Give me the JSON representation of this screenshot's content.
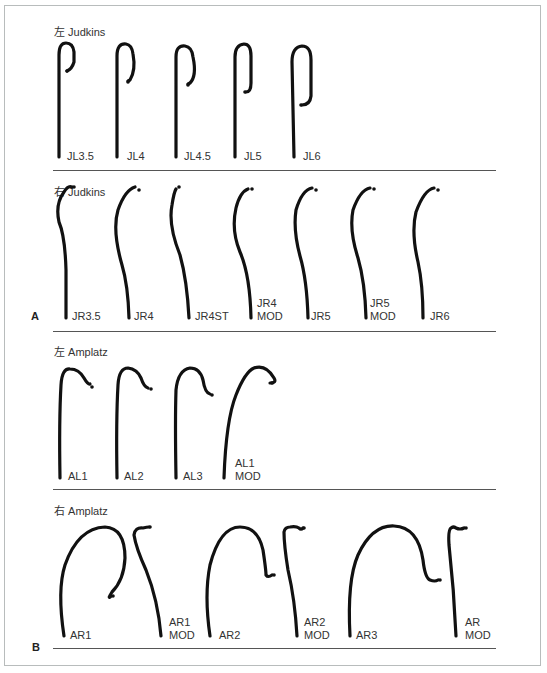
{
  "figure": {
    "sections": [
      {
        "id": "left-judkins",
        "title": "左 Judkins",
        "catheters": [
          "JL3.5",
          "JL4",
          "JL4.5",
          "JL5",
          "JL6"
        ]
      },
      {
        "id": "right-judkins",
        "title": "右 Judkins",
        "catheters": [
          "JR3.5",
          "JR4",
          "JR4ST",
          "JR4\nMOD",
          "JR5",
          "JR5\nMOD",
          "JR6"
        ]
      },
      {
        "id": "left-amplatz",
        "title": "左 Amplatz",
        "catheters": [
          "AL1",
          "AL2",
          "AL3",
          "AL1\nMOD"
        ]
      },
      {
        "id": "right-amplatz",
        "title": "右 Amplatz",
        "catheters": [
          "AR1",
          "AR1\nMOD",
          "AR2",
          "AR2\nMOD",
          "AR3",
          "AR\nMOD"
        ]
      }
    ],
    "panel_labels": {
      "a": "A",
      "b": "B"
    },
    "labels": {
      "jl": {
        "0": "JL3.5",
        "1": "JL4",
        "2": "JL4.5",
        "3": "JL5",
        "4": "JL6"
      },
      "jr": {
        "0": "JR3.5",
        "1": "JR4",
        "2": "JR4ST",
        "3a": "JR4",
        "3b": "MOD",
        "4": "JR5",
        "5a": "JR5",
        "5b": "MOD",
        "6": "JR6"
      },
      "al": {
        "0": "AL1",
        "1": "AL2",
        "2": "AL3",
        "3a": "AL1",
        "3b": "MOD"
      },
      "ar": {
        "0": "AR1",
        "1a": "AR1",
        "1b": "MOD",
        "2": "AR2",
        "3a": "AR2",
        "3b": "MOD",
        "4": "AR3",
        "5a": "AR",
        "5b": "MOD"
      }
    },
    "titles": {
      "jl": "左 Judkins",
      "jr": "右 Judkins",
      "al": "左 Amplatz",
      "ar": "右 Amplatz"
    }
  }
}
